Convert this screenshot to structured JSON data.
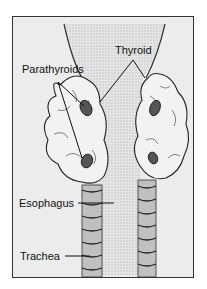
{
  "diagram": {
    "type": "anatomical-illustration",
    "labels": {
      "thyroid": "Thyroid",
      "parathyroids": "Parathyroids",
      "esophagus": "Esophagus",
      "trachea": "Trachea"
    },
    "colors": {
      "background": "#ececec",
      "frame": "#333333",
      "line": "#111111"
    }
  }
}
